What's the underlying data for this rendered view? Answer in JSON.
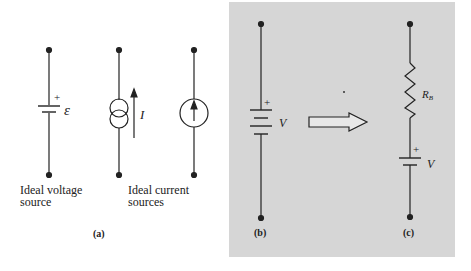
{
  "figure": {
    "panel_a": {
      "caption": "(a)",
      "voltage_source": {
        "symbol": "ε",
        "polarity": "+",
        "label_line1": "Ideal voltage",
        "label_line2": "source"
      },
      "current_source_1": {
        "symbol": "I"
      },
      "current_sources_label_line1": "Ideal current",
      "current_sources_label_line2": "sources"
    },
    "panel_b": {
      "caption": "(b)",
      "symbol": "V",
      "polarity": "+"
    },
    "panel_c": {
      "caption": "(c)",
      "resistor_label": "R",
      "resistor_subscript": "B",
      "source_symbol": "V",
      "polarity": "+"
    }
  }
}
